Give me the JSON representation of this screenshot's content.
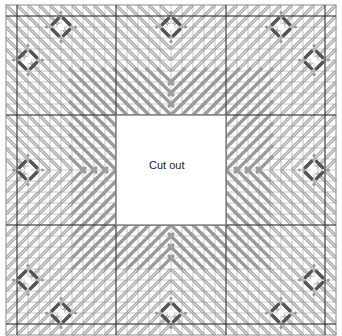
{
  "diagram": {
    "type": "needlepoint-stitch-chart",
    "center_label": "Cut out",
    "grid": {
      "cells": 30,
      "cell_px": 11,
      "origin_x": 6,
      "origin_y": 5
    },
    "cutout": {
      "col": 10,
      "row": 10,
      "cols": 10,
      "rows": 10
    },
    "colors": {
      "background": "#ffffff",
      "grid_line": "#b8b8b8",
      "major_line": "#333333",
      "border": "#999999",
      "light_stitch": "#d8d8d8",
      "stitch_outline": "#888888",
      "dark_stitch": "#9a9a9a",
      "ring": "#555555",
      "ring_accent": "#999999"
    },
    "major_line_positions": [
      1,
      10,
      20,
      29
    ],
    "rings": [
      {
        "c": 5,
        "r": 2
      },
      {
        "c": 15,
        "r": 2
      },
      {
        "c": 25,
        "r": 2
      },
      {
        "c": 2,
        "r": 5
      },
      {
        "c": 28,
        "r": 5
      },
      {
        "c": 2,
        "r": 15
      },
      {
        "c": 28,
        "r": 15
      },
      {
        "c": 2,
        "r": 25
      },
      {
        "c": 28,
        "r": 25
      },
      {
        "c": 5,
        "r": 28
      },
      {
        "c": 15,
        "r": 28
      },
      {
        "c": 25,
        "r": 28
      }
    ]
  }
}
